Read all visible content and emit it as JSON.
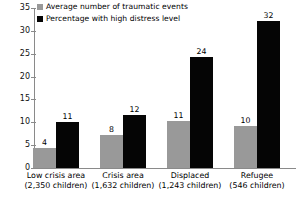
{
  "chart_data": {
    "type": "bar",
    "title": "",
    "subtitle": "",
    "xlabel": "",
    "ylabel": "",
    "ylim": [
      0,
      35
    ],
    "ytick_step": 5,
    "yticks": [
      "0",
      "5",
      "10",
      "15",
      "20",
      "25",
      "30",
      "35"
    ],
    "grid": false,
    "legend_position": "top-left",
    "categories": [
      "Low crisis area",
      "Crisis area",
      "Displaced",
      "Refugee"
    ],
    "category_sublabels": [
      "(2,350 children)",
      "(1,632 children)",
      "(1,243 children)",
      "(546 children)"
    ],
    "series": [
      {
        "name": "Average number of traumatic events",
        "color": "#999999",
        "values": [
          4,
          8,
          11,
          10
        ],
        "plotted_values": [
          4.3,
          7.3,
          10.3,
          9.3
        ]
      },
      {
        "name": "Percentage with high distress level",
        "color": "#050505",
        "values": [
          11,
          12,
          24,
          32
        ],
        "plotted_values": [
          10.1,
          11.5,
          24.3,
          32.2
        ]
      }
    ]
  },
  "legend": {
    "items": [
      {
        "label": "Average number of traumatic events",
        "color": "#999999"
      },
      {
        "label": "Percentage with high distress level",
        "color": "#050505"
      }
    ]
  }
}
